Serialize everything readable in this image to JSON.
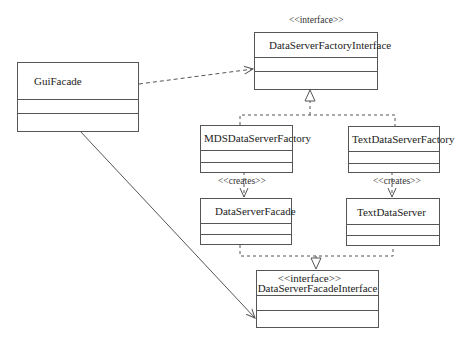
{
  "diagram": {
    "type": "UML class diagram",
    "classes": [
      {
        "id": "gui_facade",
        "name": "GuiFacade"
      },
      {
        "id": "ds_factory_iface",
        "name": "DataServerFactoryInterface",
        "stereotype": "<<interface>>"
      },
      {
        "id": "mds_ds_factory",
        "name": "MDSDataServerFactory"
      },
      {
        "id": "text_ds_factory",
        "name": "TextDataServerFactory"
      },
      {
        "id": "ds_facade",
        "name": "DataServerFacade"
      },
      {
        "id": "text_ds",
        "name": "TextDataServer"
      },
      {
        "id": "ds_facade_iface",
        "name": "DataServerFacadeInterface",
        "stereotype": "<<interface>>"
      }
    ],
    "relations": [
      {
        "from": "gui_facade",
        "to": "ds_factory_iface",
        "kind": "dependency"
      },
      {
        "from": "gui_facade",
        "to": "ds_facade_iface",
        "kind": "association"
      },
      {
        "from": "mds_ds_factory",
        "to": "ds_factory_iface",
        "kind": "realization"
      },
      {
        "from": "text_ds_factory",
        "to": "ds_factory_iface",
        "kind": "realization"
      },
      {
        "from": "mds_ds_factory",
        "to": "ds_facade",
        "kind": "dependency",
        "label": "<<creates>>"
      },
      {
        "from": "text_ds_factory",
        "to": "text_ds",
        "kind": "dependency",
        "label": "<<creates>>"
      },
      {
        "from": "ds_facade",
        "to": "ds_facade_iface",
        "kind": "realization"
      },
      {
        "from": "text_ds",
        "to": "ds_facade_iface",
        "kind": "realization"
      }
    ],
    "labels": {
      "creates_left": "<<creates>>",
      "creates_right": "<<creates>>"
    },
    "colors": {
      "line": "#555555",
      "background": "#ffffff"
    }
  }
}
